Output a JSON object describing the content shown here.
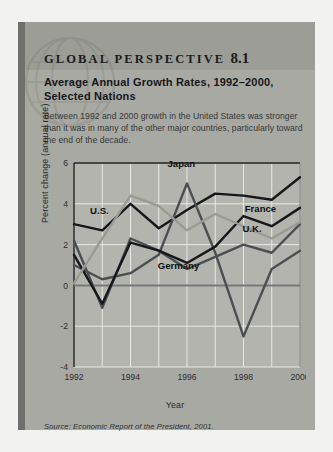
{
  "box": {
    "kicker": "GLOBAL PERSPECTIVE",
    "number": "8.1",
    "headline": "Average Annual Growth Rates, 1992–2000, Selected Nations",
    "blurb": "Between 1992 and 2000 growth in the United States was stronger than it was in many of the other major countries, particularly toward the end of the decade.",
    "source": "Source: Economic Report of the President, 2001."
  },
  "colors": {
    "box_background": "#a9a9a4",
    "top_band": "#9d9d98",
    "spine": "#6f6f6b",
    "plot_background": "#b4b4af",
    "gridline": "#e8e8e4",
    "zero_line": "#77777a",
    "series_dark": "#15181a",
    "series_mid": "#4c4f52",
    "series_light": "#9a9a95",
    "page": "#ffffff"
  },
  "chart_data": {
    "type": "line",
    "title": "Average Annual Growth Rates, 1992–2000, Selected Nations",
    "xlabel": "Year",
    "ylabel": "Percent change (annual rate)",
    "x": [
      1992,
      1993,
      1994,
      1995,
      1996,
      1997,
      1998,
      1999,
      2000
    ],
    "xticks": [
      "1992",
      "1994",
      "1996",
      "1998",
      "2000"
    ],
    "xtick_values": [
      1992,
      1994,
      1996,
      1998,
      2000
    ],
    "yticks": [
      "6",
      "4",
      "2",
      "0",
      "-2",
      "-4"
    ],
    "ytick_values": [
      6,
      4,
      2,
      0,
      -2,
      -4
    ],
    "xlim": [
      1992,
      2000
    ],
    "ylim": [
      -4,
      6
    ],
    "grid": true,
    "legend": "inline-labels",
    "series": [
      {
        "name": "U.S.",
        "color": "#15181a",
        "label_x": 1992.9,
        "label_y": 3.5,
        "values": [
          3.0,
          2.7,
          4.0,
          2.8,
          3.7,
          4.5,
          4.4,
          4.2,
          5.3
        ]
      },
      {
        "name": "Japan",
        "color": "#4c4f52",
        "label_x": 1995.8,
        "label_y": 5.8,
        "values": [
          1.0,
          0.3,
          0.6,
          1.5,
          5.0,
          1.6,
          -2.5,
          0.8,
          1.7
        ]
      },
      {
        "name": "Germany",
        "color": "#4c4f52",
        "label_x": 1995.7,
        "label_y": 0.8,
        "values": [
          2.2,
          -1.1,
          2.3,
          1.7,
          0.8,
          1.4,
          2.0,
          1.6,
          3.0
        ]
      },
      {
        "name": "France",
        "color": "#15181a",
        "label_x": 1998.6,
        "label_y": 3.6,
        "values": [
          1.5,
          -0.9,
          2.1,
          1.7,
          1.1,
          1.9,
          3.4,
          2.9,
          3.8
        ]
      },
      {
        "name": "U.K.",
        "color": "#9a9a95",
        "label_x": 1998.3,
        "label_y": 2.6,
        "values": [
          0.1,
          2.3,
          4.4,
          3.9,
          2.7,
          3.5,
          2.9,
          2.3,
          3.1
        ]
      }
    ]
  }
}
